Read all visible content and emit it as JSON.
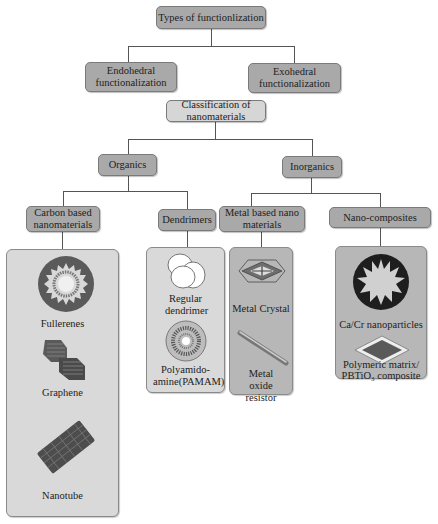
{
  "diagram": {
    "root": {
      "label": "Types of functionlization"
    },
    "types": [
      {
        "label": "Endohedral functionalization"
      },
      {
        "label": "Exohedral functionalization"
      }
    ],
    "classification": {
      "label": "Classification of nanomaterials"
    },
    "groups": [
      {
        "label": "Organics"
      },
      {
        "label": "Inorganics"
      }
    ],
    "categories": [
      {
        "label": "Carbon based nanomaterials",
        "items": [
          "Fullerenes",
          "Graphene",
          "Nanotube"
        ]
      },
      {
        "label": "Dendrimers",
        "items": [
          "Regular dendrimer",
          "Polyamido-amine(PAMAM)"
        ]
      },
      {
        "label": "Metal based nano materials",
        "items": [
          "Metal Crystal",
          "Metal oxide resistor"
        ]
      },
      {
        "label": "Nano-composites",
        "items": [
          "Ca/Cr nanoparticles",
          "Polymeric matrix/ PBTiO₃ composite"
        ]
      }
    ],
    "colors": {
      "dark_node": "#a9a9a9",
      "light_node": "#d6d6d6",
      "panel": "#d9d9d9",
      "panel_dark": "#b7b7b7",
      "icon_dark": "#555555"
    }
  }
}
